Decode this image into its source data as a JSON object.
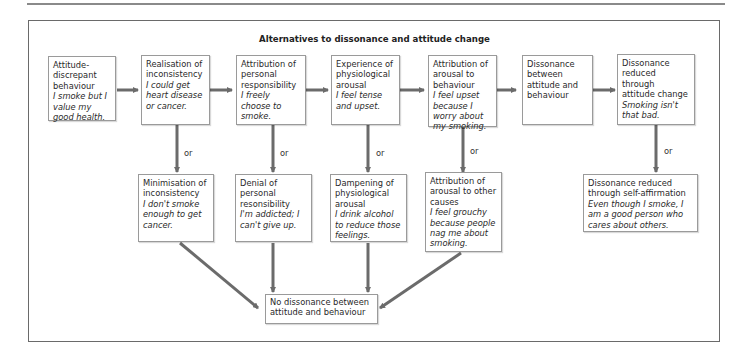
{
  "title": "Alternatives to dissonance and attitude change",
  "or_label": "or",
  "colors": {
    "arrow": "#6b6b6b",
    "border": "#9a9a9a",
    "frame": "#6a6a6a"
  },
  "top_row": [
    {
      "heading": "Attitude-discrepant behaviour",
      "example": "I smoke but I value my good health."
    },
    {
      "heading": "Realisation of inconsistency",
      "example": "I could get heart disease or cancer."
    },
    {
      "heading": "Attribution of personal responsibility",
      "example": "I freely choose to smoke."
    },
    {
      "heading": "Experience of physiological arousal",
      "example": "I feel tense and upset."
    },
    {
      "heading": "Attribution of arousal to behaviour",
      "example": "I feel upset because I worry about my smoking."
    },
    {
      "heading": "Dissonance between attitude and behaviour",
      "example": ""
    },
    {
      "heading": "Dissonance reduced through attitude change",
      "example": "Smoking isn't that bad."
    }
  ],
  "alternatives": [
    {
      "heading": "Minimisation of inconsistency",
      "example": "I don't smoke enough to get cancer."
    },
    {
      "heading": "Denial of personal resonsibility",
      "example": "I'm addicted; I can't give up."
    },
    {
      "heading": "Dampening of physiological arousal",
      "example": "I drink alcohol to reduce those feelings."
    },
    {
      "heading": "Attribution of arousal to other causes",
      "example": "I feel grouchy because people nag me about smoking."
    },
    {
      "heading": "Dissonance reduced through self-affirmation",
      "example": "Even though I smoke, I am a good person who cares about others."
    }
  ],
  "outcome": {
    "heading": "No dissonance between attitude and behaviour"
  }
}
